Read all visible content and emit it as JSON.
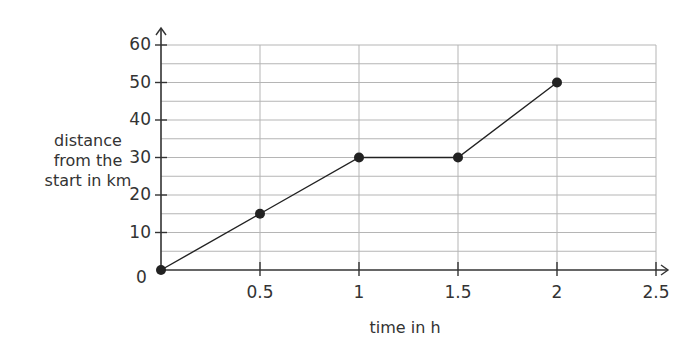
{
  "chart_data": {
    "type": "line",
    "title": "",
    "xlabel": "time in h",
    "ylabel": "distance from the start in km",
    "ylabel_lines": [
      "distance",
      "from the",
      "start in km"
    ],
    "x": [
      0,
      0.5,
      1,
      1.5,
      2
    ],
    "series": [
      {
        "name": "distance",
        "values": [
          0,
          15,
          30,
          30,
          50
        ]
      }
    ],
    "x_ticks": [
      "0.5",
      "1",
      "1.5",
      "2",
      "2.5"
    ],
    "y_ticks": [
      "10",
      "20",
      "30",
      "40",
      "50",
      "60"
    ],
    "origin_label": "0",
    "xlim": [
      0,
      2.5
    ],
    "ylim": [
      0,
      60
    ],
    "grid": true,
    "grid_minor_y": 5,
    "legend": "none",
    "colors": {
      "line": "#222222",
      "grid": "#b5b5b5",
      "axis": "#333333"
    }
  }
}
